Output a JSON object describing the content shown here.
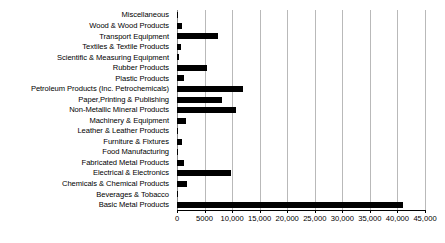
{
  "chart_data": {
    "type": "bar",
    "orientation": "horizontal",
    "title": "",
    "xlabel": "",
    "ylabel": "",
    "xlim": [
      0,
      45000
    ],
    "ylim": null,
    "grid": true,
    "legend": null,
    "bar_color": "#000000",
    "gridline_color": "#b9b9b9",
    "axis_color": "#000000",
    "xticks": [
      0,
      5000,
      10000,
      15000,
      20000,
      25000,
      30000,
      35000,
      40000,
      45000
    ],
    "xticklabels": [
      "0",
      "5000",
      "10,000",
      "15,000",
      "20,000",
      "25,000",
      "30,000",
      "35,000",
      "40,000",
      "45,000"
    ],
    "categories": [
      "Miscellaneous",
      "Wood & Wood Products",
      "Transport Equipment",
      "Textiles & Textile Products",
      "Scientific & Measuring Equipment",
      "Rubber Products",
      "Plastic Products",
      "Petroleum Products (Inc. Petrochemicals)",
      "Paper,Printing & Publishing",
      "Non-Metallic Mineral Products",
      "Machinery & Equipment",
      "Leather & Leather Products",
      "Furniture & Fixtures",
      "Food Manufacturing",
      "Fabricated Metal Products",
      "Electrical & Electronics",
      "Chemicals & Chemical Products",
      "Beverages & Tobacco",
      "Basic Metal Products"
    ],
    "values": [
      100,
      900,
      7400,
      800,
      300,
      5400,
      1300,
      12000,
      8200,
      10700,
      1700,
      150,
      900,
      200,
      1200,
      9800,
      1800,
      200,
      41000
    ]
  }
}
